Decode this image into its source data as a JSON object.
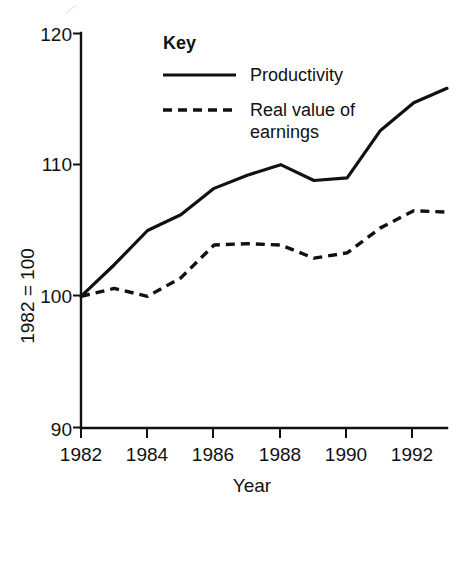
{
  "figure": {
    "background": "#ffffff",
    "ink_color": "#111111"
  },
  "chart_data": {
    "type": "line",
    "title": "",
    "xlabel": "Year",
    "ylabel": "1982 = 100",
    "x": [
      1982,
      1983,
      1984,
      1985,
      1986,
      1987,
      1988,
      1989,
      1990,
      1991,
      1992,
      1993
    ],
    "xlim": [
      1982,
      1993
    ],
    "ylim": [
      90,
      120
    ],
    "yticks": [
      90,
      100,
      110,
      120
    ],
    "ytick_labels": [
      "90",
      "100",
      "110",
      "120"
    ],
    "xticks": [
      1982,
      1984,
      1986,
      1988,
      1990,
      1992
    ],
    "xtick_labels": [
      "1982",
      "1984",
      "1986",
      "1988",
      "1990",
      "1992"
    ],
    "grid": false,
    "legend_position": "upper-left-inside",
    "series": [
      {
        "name": "Productivity",
        "style": "solid",
        "values": [
          100.0,
          102.4,
          105.0,
          106.2,
          108.2,
          109.2,
          110.0,
          108.8,
          109.0,
          112.6,
          114.7,
          115.8
        ]
      },
      {
        "name": "Real value of earnings",
        "style": "dashed",
        "values": [
          100.0,
          100.6,
          100.0,
          101.4,
          103.9,
          104.0,
          103.9,
          102.9,
          103.3,
          105.2,
          106.5,
          106.4
        ]
      }
    ]
  },
  "legend": {
    "title": "Key",
    "entries": [
      {
        "label": "Productivity",
        "style": "solid"
      },
      {
        "label": "Real value of",
        "label_line2": "earnings",
        "style": "dashed"
      }
    ]
  },
  "axes": {
    "y_axis_title": "1982 = 100",
    "x_axis_title": "Year"
  }
}
